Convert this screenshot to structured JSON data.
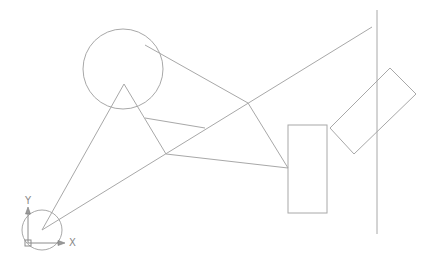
{
  "viewport": {
    "background": "#ffffff",
    "line_color": "#a8a8a8"
  },
  "ucs_icon": {
    "x_label": "X",
    "y_label": "Y"
  },
  "drawing": {
    "circles": [
      {
        "name": "large-circle",
        "cx": 123,
        "cy": 69,
        "r": 40
      },
      {
        "name": "small-circle",
        "cx": 42,
        "cy": 230,
        "r": 20
      }
    ],
    "lines": [
      {
        "x1": 42,
        "y1": 230,
        "x2": 124,
        "y2": 84
      },
      {
        "x1": 124,
        "y1": 84,
        "x2": 166,
        "y2": 154
      },
      {
        "x1": 42,
        "y1": 230,
        "x2": 372,
        "y2": 27
      },
      {
        "x1": 166,
        "y1": 154,
        "x2": 288,
        "y2": 168
      },
      {
        "x1": 145,
        "y1": 118,
        "x2": 205,
        "y2": 128
      },
      {
        "x1": 145,
        "y1": 45,
        "x2": 248,
        "y2": 103
      },
      {
        "x1": 248,
        "y1": 103,
        "x2": 288,
        "y2": 168
      },
      {
        "x1": 377,
        "y1": 10,
        "x2": 377,
        "y2": 234
      }
    ],
    "rectangle": {
      "x": 288,
      "y": 125,
      "w": 39,
      "h": 88
    },
    "rotated_rectangle": {
      "points": "390,68 416,94 354,154 330,128"
    }
  }
}
